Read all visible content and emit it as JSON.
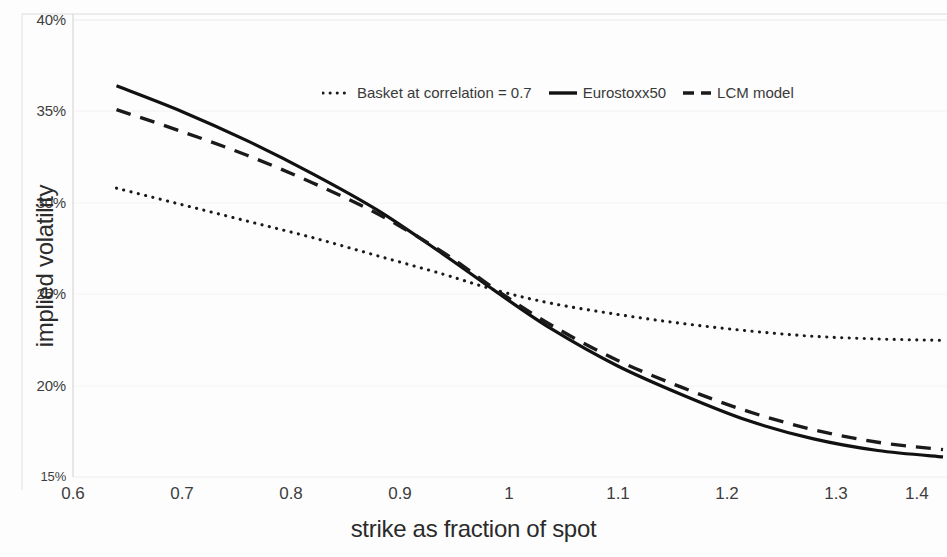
{
  "chart_data": {
    "type": "line",
    "title": "",
    "xlabel": "strike as fraction of spot",
    "ylabel": "implied volatility",
    "xlim": [
      0.6,
      1.4
    ],
    "ylim": [
      0.15,
      0.4
    ],
    "xticks": [
      "0.6",
      "0.7",
      "0.8",
      "0.9",
      "1",
      "1.1",
      "1.2",
      "1.3",
      "1.4"
    ],
    "xtick_values": [
      0.6,
      0.7,
      0.8,
      0.9,
      1.0,
      1.1,
      1.2,
      1.3,
      1.4
    ],
    "yticks": [
      "15%",
      "20%",
      "25%",
      "30%",
      "35%",
      "40%"
    ],
    "ytick_values": [
      0.15,
      0.2,
      0.25,
      0.3,
      0.35,
      0.4
    ],
    "grid": true,
    "grid_axis": "y",
    "legend_position": "top-center",
    "x": [
      0.64,
      0.7,
      0.76,
      0.82,
      0.88,
      0.94,
      0.99,
      1.04,
      1.1,
      1.16,
      1.22,
      1.28,
      1.34,
      1.4
    ],
    "series": [
      {
        "name": "Basket at correlation = 0.7",
        "style": "dotted",
        "color": "#1a1a1a",
        "values": [
          0.308,
          0.299,
          0.29,
          0.281,
          0.271,
          0.261,
          0.252,
          0.245,
          0.239,
          0.234,
          0.23,
          0.227,
          0.2255,
          0.2248
        ]
      },
      {
        "name": "Eurostoxx50",
        "style": "solid",
        "color": "#111111",
        "values": [
          0.364,
          0.35,
          0.334,
          0.316,
          0.296,
          0.272,
          0.251,
          0.231,
          0.211,
          0.195,
          0.181,
          0.171,
          0.1645,
          0.161
        ]
      },
      {
        "name": "LCM model",
        "style": "dashed",
        "color": "#1a1a1a",
        "values": [
          0.351,
          0.339,
          0.326,
          0.311,
          0.294,
          0.273,
          0.252,
          0.233,
          0.214,
          0.199,
          0.186,
          0.176,
          0.169,
          0.165
        ]
      }
    ]
  },
  "legend": {
    "items": [
      {
        "label": "Basket at correlation = 0.7",
        "style": "dotted"
      },
      {
        "label": "Eurostoxx50",
        "style": "solid"
      },
      {
        "label": "LCM model",
        "style": "dashed"
      }
    ]
  },
  "axes": {
    "x_title": "strike as fraction of spot",
    "y_title": "implied volatility",
    "x_labels": [
      "0.6",
      "0.7",
      "0.8",
      "0.9",
      "1",
      "1.1",
      "1.2",
      "1.3",
      "1.4"
    ],
    "y_labels": [
      "40%",
      "35%",
      "30%",
      "25%",
      "20%",
      "15%"
    ]
  },
  "colors": {
    "line": "#1a1a1a",
    "grid": "#efefef",
    "axis": "#d4d4d4",
    "text": "#3d3d3d"
  }
}
